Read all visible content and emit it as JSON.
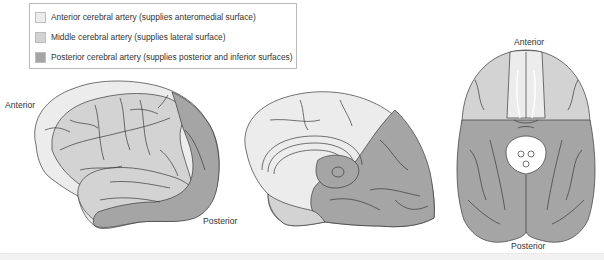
{
  "legend": {
    "items": [
      {
        "label": "Anterior cerebral artery (supplies anteromedial surface)",
        "color": "#ececec"
      },
      {
        "label": "Middle cerebral artery (supplies lateral surface)",
        "color": "#d3d3d3"
      },
      {
        "label": "Posterior cerebral artery (supplies posterior and inferior surfaces)",
        "color": "#a5a5a5"
      }
    ]
  },
  "views": {
    "lateral": {
      "anterior_label": "Anterior",
      "posterior_label": "Posterior"
    },
    "medial": {},
    "inferior": {
      "anterior_label": "Anterior",
      "posterior_label": "Posterior"
    }
  },
  "colors": {
    "anterior": "#ececec",
    "middle": "#d3d3d3",
    "posterior": "#a5a5a5",
    "outline": "#3a3a3a"
  }
}
